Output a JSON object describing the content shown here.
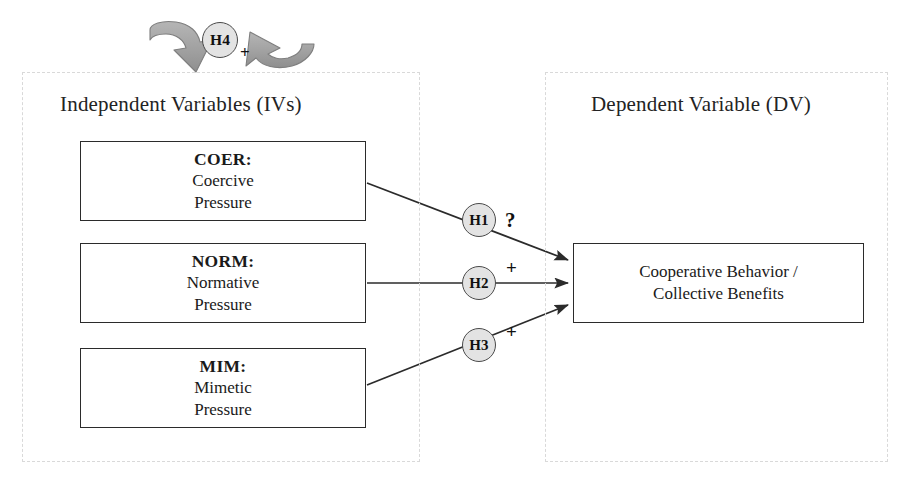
{
  "diagram": {
    "title_left": "Independent Variables (IVs)",
    "title_right": "Dependent Variable (DV)",
    "independent_variables": [
      {
        "code": "COER:",
        "line1": "Coercive",
        "line2": "Pressure"
      },
      {
        "code": "NORM:",
        "line1": "Normative",
        "line2": "Pressure"
      },
      {
        "code": "MIM:",
        "line1": "Mimetic",
        "line2": "Pressure"
      }
    ],
    "dependent_variable": {
      "line1": "Cooperative Behavior /",
      "line2": "Collective Benefits"
    },
    "hypotheses": [
      {
        "id": "H1",
        "sign": "?",
        "from": "COER",
        "to": "DV"
      },
      {
        "id": "H2",
        "sign": "+",
        "from": "NORM",
        "to": "DV"
      },
      {
        "id": "H3",
        "sign": "+",
        "from": "MIM",
        "to": "DV"
      },
      {
        "id": "H4",
        "sign": "+",
        "from": "IVs",
        "to": "IVs"
      }
    ],
    "colors": {
      "box_border": "#2b2b2b",
      "badge_fill": "#e3e3e3",
      "badge_border": "#4a4a4a",
      "loop_arrow_fill": "#a6a6a6",
      "region_border": "#d9d9d9",
      "arrow_line": "#2b2b2b",
      "background": "#ffffff"
    }
  }
}
